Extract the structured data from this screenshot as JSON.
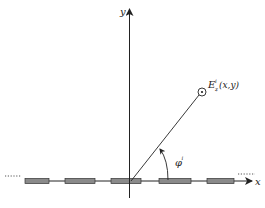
{
  "diagram": {
    "axes": {
      "x_label": "x",
      "y_label": "y"
    },
    "field_point": {
      "symbol": "E",
      "superscript": "i",
      "subscript": "z",
      "args": "(x,y)"
    },
    "angle": {
      "symbol": "φ",
      "superscript": "i"
    },
    "strips": [
      {
        "x": 25,
        "w": 24
      },
      {
        "x": 65,
        "w": 30
      },
      {
        "x": 111,
        "w": 30
      },
      {
        "x": 159,
        "w": 32
      },
      {
        "x": 207,
        "w": 27
      }
    ],
    "colors": {
      "strip_fill": "#8a8a8a",
      "line": "#222222"
    }
  }
}
